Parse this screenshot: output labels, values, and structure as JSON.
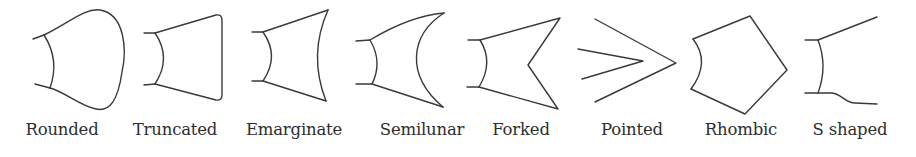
{
  "figure": {
    "stroke_color": "#3a3a3a",
    "background": "#ffffff",
    "shapes": [
      {
        "id": "rounded",
        "label": "Rounded",
        "label_center_x": 62
      },
      {
        "id": "truncated",
        "label": "Truncated",
        "label_center_x": 175
      },
      {
        "id": "emarginate",
        "label": "Emarginate",
        "label_center_x": 294
      },
      {
        "id": "semilunar",
        "label": "Semilunar",
        "label_center_x": 422
      },
      {
        "id": "forked",
        "label": "Forked",
        "label_center_x": 521
      },
      {
        "id": "pointed",
        "label": "Pointed",
        "label_center_x": 632
      },
      {
        "id": "rhombic",
        "label": "Rhombic",
        "label_center_x": 741
      },
      {
        "id": "s-shaped",
        "label": "S shaped",
        "label_center_x": 850
      }
    ]
  }
}
